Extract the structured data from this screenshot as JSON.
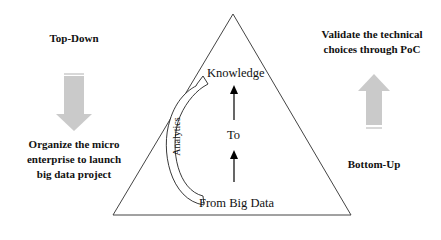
{
  "left": {
    "heading": "Top-Down",
    "arrow_direction": "down",
    "caption_lines": [
      "Organize the micro",
      "enterprise to launch",
      "big data project"
    ]
  },
  "right": {
    "caption_lines": [
      "Validate the technical",
      "choices through PoC"
    ],
    "arrow_direction": "up",
    "heading": "Bottom-Up"
  },
  "pyramid": {
    "top_label": "Knowledge",
    "middle_label": "To",
    "bottom_label": "From Big Data",
    "side_arrow_label": "Analytics"
  },
  "colors": {
    "arrow_fill": "#c8c8c8",
    "line": "#333333"
  }
}
